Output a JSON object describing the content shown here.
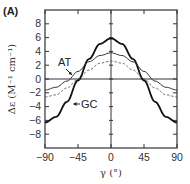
{
  "panel_label": "(A)",
  "chart_data": {
    "type": "line",
    "title": "",
    "xlabel": "γ (°)",
    "ylabel": "Δε (M⁻¹ cm⁻¹)",
    "xlim": [
      -90,
      90
    ],
    "ylim": [
      -10,
      10
    ],
    "xticks": [
      -90,
      -45,
      0,
      45,
      90
    ],
    "yticks": [
      8,
      6,
      4,
      2,
      0,
      -2,
      -4,
      -6,
      -8
    ],
    "grid": false,
    "zero_line": true,
    "x": [
      -90,
      -75,
      -60,
      -45,
      -30,
      -15,
      0,
      15,
      30,
      45,
      60,
      75,
      90
    ],
    "series": [
      {
        "name": "GC",
        "style": "solid-thick",
        "values": [
          -6.3,
          -5.5,
          -3.3,
          -0.2,
          2.9,
          5.1,
          5.9,
          5.1,
          2.9,
          -0.2,
          -3.3,
          -5.5,
          -6.3
        ]
      },
      {
        "name": "AT",
        "style": "solid-thin",
        "values": [
          -1.6,
          -1.2,
          -0.3,
          1.1,
          2.5,
          3.4,
          3.8,
          3.4,
          2.5,
          1.1,
          -0.3,
          -1.2,
          -1.6
        ]
      },
      {
        "name": "AT (dashed)",
        "style": "dashed",
        "values": [
          -2.6,
          -2.3,
          -1.3,
          0.0,
          1.3,
          2.3,
          2.6,
          2.3,
          1.3,
          0.0,
          -1.3,
          -2.3,
          -2.6
        ]
      }
    ],
    "annotations": [
      {
        "text": "AT",
        "points_to": "AT"
      },
      {
        "text": "GC",
        "points_to": "GC"
      }
    ],
    "legend": "none (inline annotations)"
  }
}
